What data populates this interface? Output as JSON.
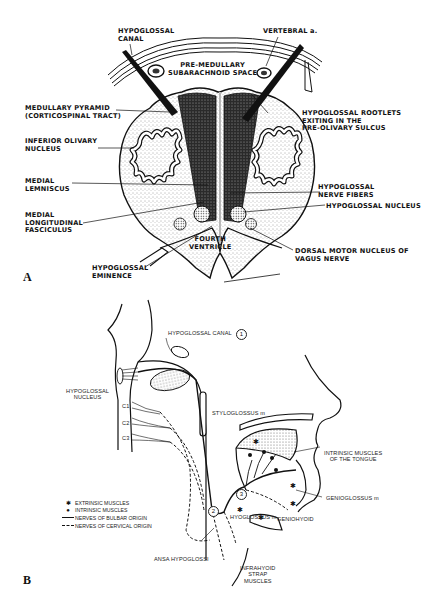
{
  "figure": {
    "panel_a": {
      "letter": "A",
      "title": "Cross-section of medulla at level of hypoglossal nucleus",
      "labels": {
        "hypoglossal_canal": "HYPOGLOSSAL\nCANAL",
        "vertebral_artery": "VERTEBRAL a.",
        "pre_medullary_space": "PRE-MEDULLARY\nSUBARACHNOID SPACE",
        "medullary_pyramid": "MEDULLARY PYRAMID\n(CORTICOSPINAL TRACT)",
        "hypoglossal_rootlets": "HYPOGLOSSAL ROOTLETS\nEXITING IN THE\nPRE-OLIVARY SULCUS",
        "inferior_olivary_nucleus": "INFERIOR OLIVARY\nNUCLEUS",
        "medial_lemniscus": "MEDIAL\nLEMNISCUS",
        "hypoglossal_nerve_fibers": "HYPOGLOSSAL\nNERVE FIBERS",
        "medial_longitudinal_fasciculus": "MEDIAL\nLONGITUDINAL\nFASCICULUS",
        "hypoglossal_nucleus": "HYPOGLOSSAL NUCLEUS",
        "fourth_ventricle": "FOURTH\nVENTRICLE",
        "dorsal_motor_nucleus": "DORSAL MOTOR NUCLEUS OF\nVAGUS NERVE",
        "hypoglossal_eminence": "HYPOGLOSSAL\nEMINENCE"
      }
    },
    "panel_b": {
      "letter": "B",
      "labels": {
        "hypoglossal_canal": "HYPOGLOSSAL CANAL",
        "hypoglossal_nucleus": "HYPOGLOSSAL\nNUCLEUS",
        "c1": "C1",
        "c2": "C2",
        "c3": "C3",
        "styloglossus": "STYLOGLOSSUS m",
        "intrinsic_muscles_tongue": "INTRINSIC MUSCLES\nOF THE TONGUE",
        "genioglossus": "GENIOGLOSSUS m",
        "hyoglossus": "HYOGLOSSUS m",
        "geniohyoid": "GENIOHYOID",
        "ansa_hypoglossi": "ANSA HYPOGLOSSI",
        "infrahyoid_strap": "INFRAHYOID\nSTRAP\nMUSCLES"
      },
      "circled_numbers": [
        "1",
        "2",
        "3"
      ],
      "legend": [
        {
          "symbol": "star",
          "glyph": "✱",
          "text": "EXTRINSIC MUSCLES"
        },
        {
          "symbol": "dot",
          "glyph": "●",
          "text": "INTRINSIC MUSCLES"
        },
        {
          "symbol": "solid-line",
          "glyph": "",
          "text": "NERVES OF BULBAR ORIGIN"
        },
        {
          "symbol": "dashed-line",
          "glyph": "",
          "text": "NERVES OF CERVICAL ORIGIN"
        }
      ]
    },
    "colors": {
      "ink": "#111111",
      "paper": "#ffffff",
      "stipple": "#555555"
    }
  }
}
